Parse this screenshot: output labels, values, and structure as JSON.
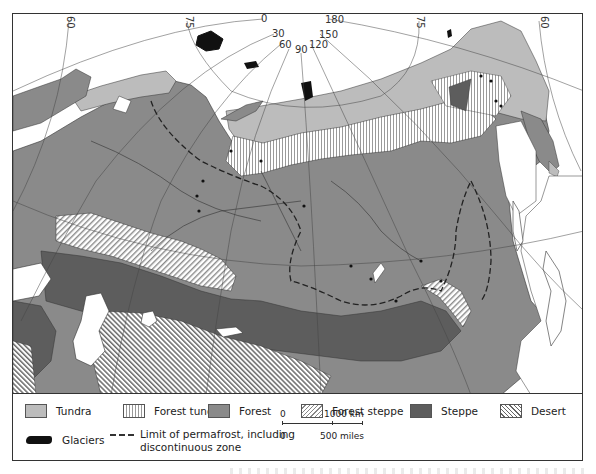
{
  "map": {
    "subject": "Natural vegetation zones of the USSR",
    "graticule_labels": {
      "meridians": [
        "0",
        "30",
        "60",
        "90",
        "120",
        "150",
        "180"
      ],
      "parallels_left": [
        "60",
        "75"
      ],
      "parallels_right": [
        "75",
        "60"
      ]
    },
    "colors": {
      "ocean": "#ffffff",
      "tundra": "#bcbcbc",
      "forest_tundra_stripe": "#999999",
      "forest": "#8a8a8a",
      "forest_steppe_hatch": "#888888",
      "steppe": "#5d5d5d",
      "desert_hatch": "#666666",
      "glaciers": "#111111",
      "boundaries": "#333333"
    }
  },
  "legend": {
    "items": [
      {
        "key": "tundra",
        "label": "Tundra"
      },
      {
        "key": "forest_tundra",
        "label": "Forest tundra"
      },
      {
        "key": "forest",
        "label": "Forest"
      },
      {
        "key": "forest_steppe",
        "label": "Forest steppe"
      },
      {
        "key": "steppe",
        "label": "Steppe"
      },
      {
        "key": "desert",
        "label": "Desert"
      }
    ],
    "glaciers_label": "Glaciers",
    "permafrost_line1": "Limit of permafrost, including",
    "permafrost_line2": "discontinuous zone"
  },
  "scale": {
    "km_zero": "0",
    "km_end": "1000 km",
    "mi_zero": "0",
    "mi_end": "500 miles"
  }
}
